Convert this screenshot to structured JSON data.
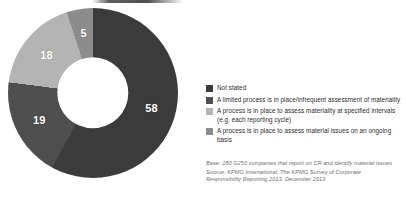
{
  "chart_data": {
    "type": "pie",
    "title": "",
    "subtitle": "",
    "xlabel": "",
    "ylabel": "",
    "donut": true,
    "legend_position": "right",
    "grid": false,
    "units": "percent",
    "categories": [
      "Not stated",
      "A limited process is in place/infrequent assessment of materiality",
      "A process is in place to assess materiality at specified intervals (e.g. each reporting cycle)",
      "A process is in place to assess material issues on an ongoing basis"
    ],
    "values": [
      58,
      19,
      18,
      5
    ],
    "colors": [
      "#3b3b3b",
      "#4e4e4e",
      "#b4b4b4",
      "#8c8c8c"
    ],
    "data_labels": [
      "58",
      "19",
      "18",
      "5"
    ]
  },
  "legend": {
    "items": [
      {
        "label": "Not stated",
        "color": "#3b3b3b"
      },
      {
        "label": "A limited process is in place/infrequent assessment of materiality",
        "color": "#4e4e4e"
      },
      {
        "label": "A process is in place to assess materiality at specified intervals (e.g. each reporting cycle)",
        "color": "#b4b4b4"
      },
      {
        "label": "A process is in place to assess material issues on an ongoing basis",
        "color": "#8c8c8c"
      }
    ]
  },
  "notes": {
    "base": "Base: 180 G250 companies that report on CR and identify material issues",
    "source": "Source: KPMG International, The KPMG Survey of Corporate Responsibility Reporting 2013, December 2013"
  }
}
